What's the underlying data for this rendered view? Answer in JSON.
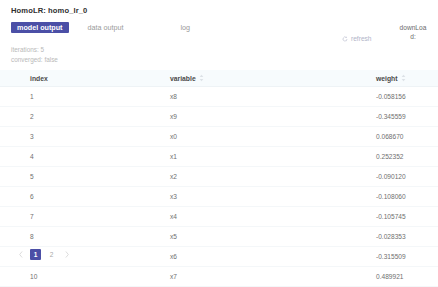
{
  "header": {
    "title": "HomoLR: homo_lr_0"
  },
  "tabs": [
    {
      "label": "model output",
      "active": true
    },
    {
      "label": "data output",
      "active": false
    },
    {
      "label": "log",
      "active": false
    }
  ],
  "actions": {
    "refresh_label": "refresh",
    "refresh_icon": "refresh-icon",
    "download_label": "downLoad:"
  },
  "summary": {
    "iterations": "iterations: 5",
    "converged": "converged: false"
  },
  "table": {
    "columns": [
      {
        "label": "index",
        "sortable": false
      },
      {
        "label": "variable",
        "sortable": true
      },
      {
        "label": "weight",
        "sortable": true
      }
    ],
    "rows": [
      {
        "index": "1",
        "variable": "x8",
        "weight": "-0.058156"
      },
      {
        "index": "2",
        "variable": "x9",
        "weight": "-0.345559"
      },
      {
        "index": "3",
        "variable": "x0",
        "weight": "0.068670"
      },
      {
        "index": "4",
        "variable": "x1",
        "weight": "0.252352"
      },
      {
        "index": "5",
        "variable": "x2",
        "weight": "-0.090120"
      },
      {
        "index": "6",
        "variable": "x3",
        "weight": "-0.108060"
      },
      {
        "index": "7",
        "variable": "x4",
        "weight": "-0.105745"
      },
      {
        "index": "8",
        "variable": "x5",
        "weight": "-0.028353"
      },
      {
        "index": "9",
        "variable": "x6",
        "weight": "-0.315509"
      },
      {
        "index": "10",
        "variable": "x7",
        "weight": "0.489921"
      }
    ]
  },
  "pagination": {
    "prev_icon": "chevron-left-icon",
    "next_icon": "chevron-right-icon",
    "pages": [
      {
        "label": "1",
        "active": true
      },
      {
        "label": "2",
        "active": false
      }
    ]
  },
  "colors": {
    "accent": "#4b4fa6",
    "header_bg": "#f7fbfd",
    "text_muted": "#b9b9b9"
  }
}
